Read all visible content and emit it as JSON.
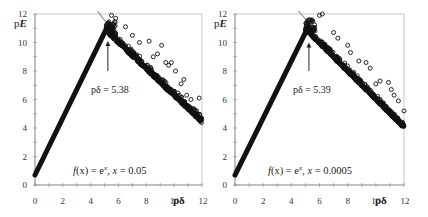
{
  "chart_data": [
    {
      "type": "scatter",
      "panel": "left",
      "title": "",
      "xlabel": "pδ",
      "ylabel": "pE",
      "xlim": [
        0,
        12
      ],
      "ylim": [
        0,
        12
      ],
      "xticks": [
        0,
        2,
        4,
        6,
        8,
        10,
        12
      ],
      "yticks": [
        0,
        2,
        4,
        6,
        8,
        10,
        12
      ],
      "grid": false,
      "rising_segment": {
        "x": [
          0,
          5.1
        ],
        "y": [
          0.7,
          10.9
        ]
      },
      "falling_trend": {
        "x": [
          5.1,
          12
        ],
        "y": [
          10.9,
          4.5
        ]
      },
      "peak_marker_line": {
        "x": [
          4.5,
          5.5
        ],
        "y": [
          12.2,
          10.9
        ]
      },
      "annotation": {
        "text": "pδ = 5.38",
        "arrow_x": 5.38,
        "arrow_from_y": 8.0,
        "arrow_to_y": 10.1
      },
      "formula": {
        "prefix": "f(x) = e",
        "sup": "x",
        "suffix": ",  x = 0.05"
      },
      "noise": 0.45,
      "outliers": [
        [
          5.5,
          11.9
        ],
        [
          5.8,
          11.7
        ],
        [
          6.5,
          11.1
        ],
        [
          7.0,
          10.5
        ],
        [
          7.5,
          10.0
        ],
        [
          8.2,
          10.1
        ],
        [
          8.5,
          9.0
        ],
        [
          9.1,
          9.8
        ],
        [
          9.4,
          8.6
        ],
        [
          9.8,
          8.6
        ],
        [
          10.1,
          8.0
        ],
        [
          10.5,
          7.1
        ],
        [
          10.7,
          7.4
        ],
        [
          11.2,
          6.0
        ],
        [
          11.8,
          6.1
        ],
        [
          8.8,
          9.2
        ],
        [
          9.6,
          8.4
        ],
        [
          10.9,
          6.3
        ]
      ]
    },
    {
      "type": "scatter",
      "panel": "right",
      "title": "",
      "xlabel": "pδ",
      "ylabel": "pE",
      "xlim": [
        0,
        12
      ],
      "ylim": [
        0,
        12
      ],
      "xticks": [
        0,
        2,
        4,
        6,
        8,
        10,
        12
      ],
      "yticks": [
        0,
        2,
        4,
        6,
        8,
        10,
        12
      ],
      "grid": false,
      "rising_segment": {
        "x": [
          0,
          5.0
        ],
        "y": [
          0.7,
          10.7
        ]
      },
      "falling_trend": {
        "x": [
          5.0,
          12
        ],
        "y": [
          11.0,
          4.1
        ]
      },
      "peak_marker_line": {
        "x": [
          4.5,
          5.6
        ],
        "y": [
          12.2,
          11.0
        ]
      },
      "annotation": {
        "text": "pδ = 5.39",
        "arrow_x": 5.39,
        "arrow_from_y": 8.0,
        "arrow_to_y": 10.0
      },
      "formula": {
        "prefix": "f(x) = e",
        "sup": "x",
        "suffix": ",  x = 0.0005"
      },
      "noise": 0.4,
      "outliers": [
        [
          6.0,
          11.9
        ],
        [
          6.2,
          12.0
        ],
        [
          7.0,
          10.7
        ],
        [
          7.3,
          10.3
        ],
        [
          8.0,
          9.8
        ],
        [
          8.2,
          9.3
        ],
        [
          8.8,
          8.7
        ],
        [
          9.3,
          8.6
        ],
        [
          9.6,
          8.2
        ],
        [
          10.3,
          7.3
        ],
        [
          10.9,
          7.2
        ],
        [
          11.1,
          6.7
        ],
        [
          11.6,
          5.9
        ],
        [
          12.0,
          5.2
        ],
        [
          10.0,
          7.1
        ],
        [
          11.3,
          6.3
        ]
      ]
    }
  ],
  "axes": {
    "tick_labels": [
      "0",
      "2",
      "4",
      "6",
      "8",
      "10",
      "12"
    ],
    "x_name": "pδ",
    "y_name_prefix": "p",
    "y_name_var": "E"
  },
  "panels": [
    {
      "annotation": "pδ = 5.38",
      "formula_f": "f",
      "formula_x": "(x)",
      "formula_eq": " = e",
      "formula_sup": "x",
      "formula_rest": ",  ",
      "formula_var": "x",
      "formula_val": " = 0.05"
    },
    {
      "annotation": "pδ = 5.39",
      "formula_f": "f",
      "formula_x": "(x)",
      "formula_eq": " = e",
      "formula_sup": "x",
      "formula_rest": ",  ",
      "formula_var": "x",
      "formula_val": " = 0.0005"
    }
  ],
  "colors": {
    "marker": "#111111",
    "axis": "#888888",
    "frame": "#bbbbbb",
    "peak_line": "#999999",
    "text": "#222222"
  }
}
